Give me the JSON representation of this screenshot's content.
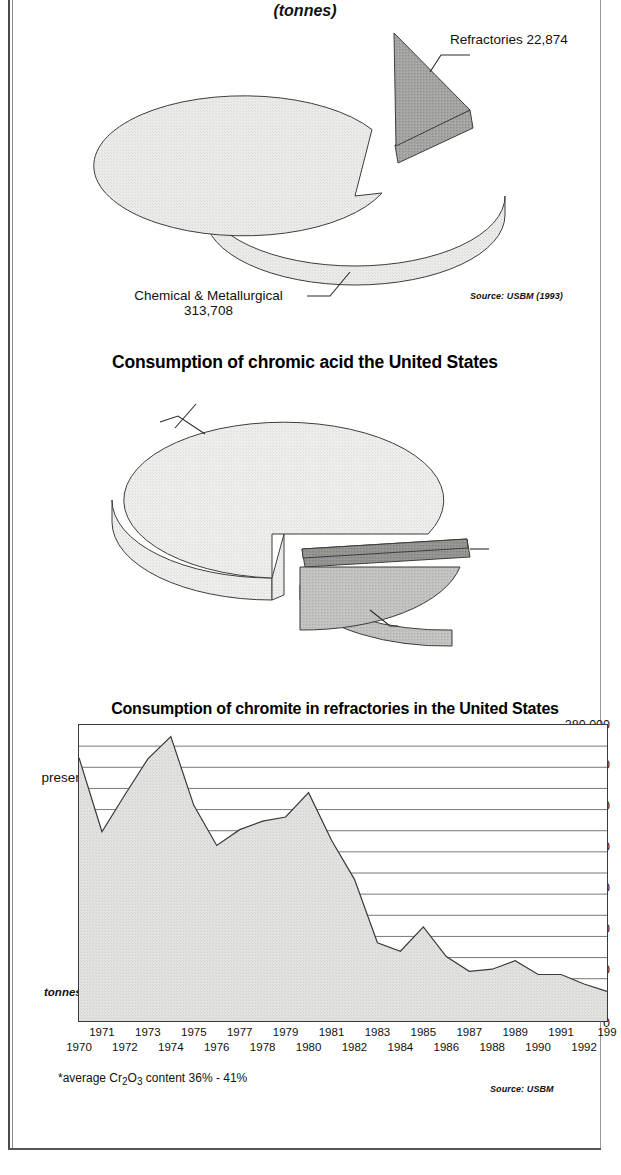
{
  "document": {
    "charts": [
      {
        "id": "chromite-consumption-us",
        "subtitle": "(tonnes)",
        "source": "Source: USBM (1993)",
        "labels": {
          "refractories": "Refractories 22,874",
          "chemical_line1": "Chemical & Metallurgical",
          "chemical_line2": "313,708"
        }
      },
      {
        "id": "chromic-acid-consumption-us",
        "title": "Consumption of chromic acid the United States",
        "source": "Source: USBM (1993)",
        "labels": {
          "wood_line1": "Wood",
          "wood_line2": "preservatives 70%",
          "chromium_dioxide_line1": "Chromium dioxide",
          "chromium_dioxide_line2": "production 3%",
          "metal_line1": "Metal finishing including",
          "metal_line2": "chromium plating,",
          "metal_line3": "aluminum anodizing 27%"
        }
      },
      {
        "id": "chromite-refractories-us",
        "title": "Consumption of chromite in refractories in the United States",
        "source": "Source: USBM",
        "footnote": "*average Cr2O3 content 36% - 41%",
        "footnote_parts": {
          "pre": "*average Cr",
          "sub1": "2",
          "mid": "O",
          "sub2": "3",
          "post": " content 36% - 41%"
        },
        "axis_unit": "tonnes"
      }
    ]
  },
  "chart_data": [
    {
      "type": "pie",
      "title": "",
      "subtitle": "(tonnes)",
      "unit": "tonnes",
      "labels": [
        "Chemical & Metallurgical",
        "Refractories"
      ],
      "values": [
        313708,
        22874
      ],
      "value_labels": [
        "313,708",
        "22,874"
      ],
      "exploded": [
        false,
        true
      ],
      "colors": [
        "#e8e8e6",
        "#9a9a98"
      ],
      "legend": "callout-labels",
      "source": "Source: USBM (1993)"
    },
    {
      "type": "pie",
      "title": "Consumption of chromic acid the United States",
      "labels": [
        "Wood preservatives",
        "Metal finishing including chromium plating, aluminum anodizing",
        "Chromium dioxide production"
      ],
      "values": [
        70,
        27,
        3
      ],
      "value_labels": [
        "70%",
        "27%",
        "3%"
      ],
      "exploded": [
        false,
        true,
        true
      ],
      "colors": [
        "#ececea",
        "#b9b9b7",
        "#8a8a88"
      ],
      "legend": "callout-labels",
      "source": "Source: USBM (1993)"
    },
    {
      "type": "area",
      "title": "Consumption of chromite in refractories in the United States",
      "xlabel": "",
      "ylabel": "tonnes",
      "ylim": [
        0,
        280000
      ],
      "ytick_step": 40000,
      "minor_gridline_step": 20000,
      "grid": true,
      "yticks": [
        0,
        40000,
        80000,
        120000,
        160000,
        200000,
        240000,
        280000
      ],
      "ytick_labels": [
        "0",
        "40,000",
        "80,000",
        "120,000",
        "160,000",
        "200,000",
        "240,000",
        "280,000"
      ],
      "x": [
        1970,
        1971,
        1972,
        1973,
        1974,
        1975,
        1976,
        1977,
        1978,
        1979,
        1980,
        1981,
        1982,
        1983,
        1984,
        1985,
        1986,
        1987,
        1988,
        1989,
        1990,
        1991,
        1992,
        1993
      ],
      "xtick_labels": [
        "1970",
        "1971",
        "1972",
        "1973",
        "1974",
        "1975",
        "1976",
        "1977",
        "1978",
        "1979",
        "1980",
        "1981",
        "1982",
        "1983",
        "1984",
        "1985",
        "1986",
        "1987",
        "1988",
        "1989",
        "1990",
        "1991",
        "1992",
        "199"
      ],
      "values": [
        249000,
        179000,
        214000,
        248000,
        269000,
        204000,
        166000,
        181000,
        189000,
        193000,
        216000,
        171000,
        134000,
        74000,
        66000,
        89000,
        61000,
        47000,
        49000,
        57000,
        44000,
        44000,
        35000,
        28000
      ],
      "series": [
        {
          "name": "Chromite consumed in refractories",
          "values": [
            249000,
            179000,
            214000,
            248000,
            269000,
            204000,
            166000,
            181000,
            189000,
            193000,
            216000,
            171000,
            134000,
            74000,
            66000,
            89000,
            61000,
            47000,
            49000,
            57000,
            44000,
            44000,
            35000,
            28000
          ]
        }
      ],
      "footnote": "*average Cr2O3 content 36% - 41%",
      "source": "Source: USBM",
      "fill_color": "#dcdcda",
      "line_color": "#3a3a3a"
    }
  ]
}
